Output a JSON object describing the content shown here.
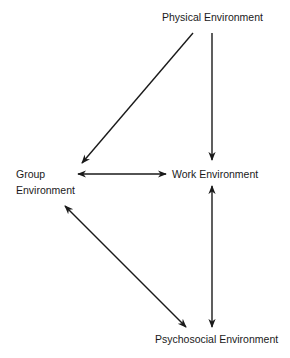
{
  "diagram": {
    "nodes": {
      "physical": {
        "label": "Physical Environment"
      },
      "group_line1": "Group",
      "group_line2": "Environment",
      "work": {
        "label": "Work Environment"
      },
      "psychosocial": {
        "label": "Psychosocial Environment"
      }
    },
    "edges": [
      {
        "from": "Physical Environment",
        "to": "Group Environment",
        "direction": "one-way"
      },
      {
        "from": "Physical Environment",
        "to": "Work Environment",
        "direction": "one-way"
      },
      {
        "from": "Group Environment",
        "to": "Work Environment",
        "direction": "two-way"
      },
      {
        "from": "Work Environment",
        "to": "Psychosocial Environment",
        "direction": "two-way"
      },
      {
        "from": "Group Environment",
        "to": "Psychosocial Environment",
        "direction": "two-way"
      }
    ],
    "colors": {
      "stroke": "#1a1a1a",
      "background": "#ffffff"
    }
  }
}
